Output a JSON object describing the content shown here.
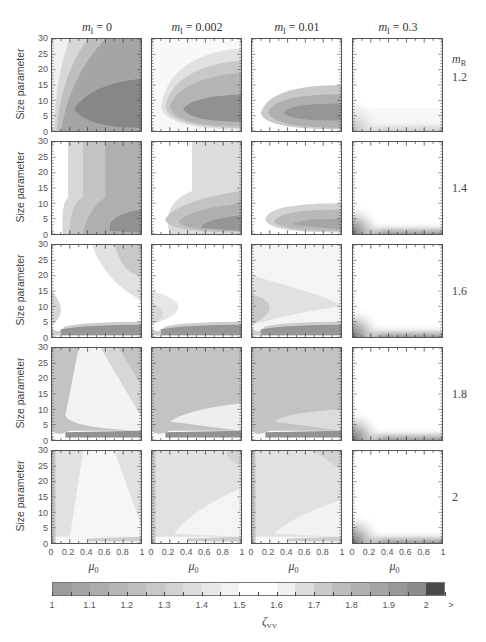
{
  "chart_data": {
    "type": "heatmap",
    "title": "",
    "layout": "5 rows x 4 columns grid of filled contour plots",
    "column_header_prefix": "m_I",
    "columns": [
      {
        "label_var": "m",
        "label_sub": "I",
        "label_value": "= 0"
      },
      {
        "label_var": "m",
        "label_sub": "I",
        "label_value": "= 0.002"
      },
      {
        "label_var": "m",
        "label_sub": "I",
        "label_value": "= 0.01"
      },
      {
        "label_var": "m",
        "label_sub": "I",
        "label_value": "= 0.3"
      }
    ],
    "row_header": {
      "var": "m",
      "sub": "R"
    },
    "rows": [
      {
        "label": "1.2"
      },
      {
        "label": "1.4"
      },
      {
        "label": "1.6"
      },
      {
        "label": "1.8"
      },
      {
        "label": "2"
      }
    ],
    "xlabel": {
      "var": "μ",
      "sub": "0"
    },
    "ylabel": "Size parameter",
    "xlim": [
      0,
      1
    ],
    "ylim": [
      0,
      30
    ],
    "x_ticks": [
      "0",
      "0.2",
      "0.4",
      "0.6",
      "0.8",
      "1"
    ],
    "y_ticks": [
      "0",
      "5",
      "10",
      "15",
      "20",
      "25",
      "30"
    ],
    "colorbar": {
      "label_var": "ζ",
      "label_sub": "VV",
      "ticks": [
        "1",
        "1.1",
        "1.2",
        "1.3",
        "1.4",
        "1.5",
        "1.6",
        "1.7",
        "1.8",
        "1.9",
        "2",
        ">"
      ],
      "range": [
        1,
        2
      ],
      "levels": 21,
      "colors": [
        "#9a9a9a",
        "#a3a3a3",
        "#acacac",
        "#b5b5b5",
        "#bebebe",
        "#c7c7c7",
        "#d2d2d2",
        "#dddddd",
        "#e8e8e8",
        "#f2f2f2",
        "#ffffff",
        "#ffffff",
        "#f0f0f0",
        "#dcdcdc",
        "#cbcbcb",
        "#bdbdbd",
        "#b0b0b0",
        "#a4a4a4",
        "#989898",
        "#8c8c8c",
        "#4a4a4a"
      ]
    },
    "panels_description": [
      [
        "dark core ~y 5-15 spreading right, lighter at small μ0",
        "dark core ~y 5-10 at large μ0",
        "moderate grey band y 0-12",
        "mostly white, slight grey at bottom-left"
      ],
      [
        "vertical grey bands increasing with μ0, dark at bottom right",
        "white top, grey bottom y<12",
        "white top, grey band y<10",
        "white with grey bottom-left corner"
      ],
      [
        "white with dark band y~2 and grey at top-right",
        "white with dark band y~2",
        "light grey with dark band y~2",
        "white with dark corner"
      ],
      [
        "grey top-left, white wedge, dark band y~2",
        "grey with white wedge, dark band y~2",
        "grey, dark band y~2",
        "white"
      ],
      [
        "light grey with white wedge",
        "light grey with white wedge",
        "light grey with white wedge",
        "white"
      ]
    ]
  }
}
